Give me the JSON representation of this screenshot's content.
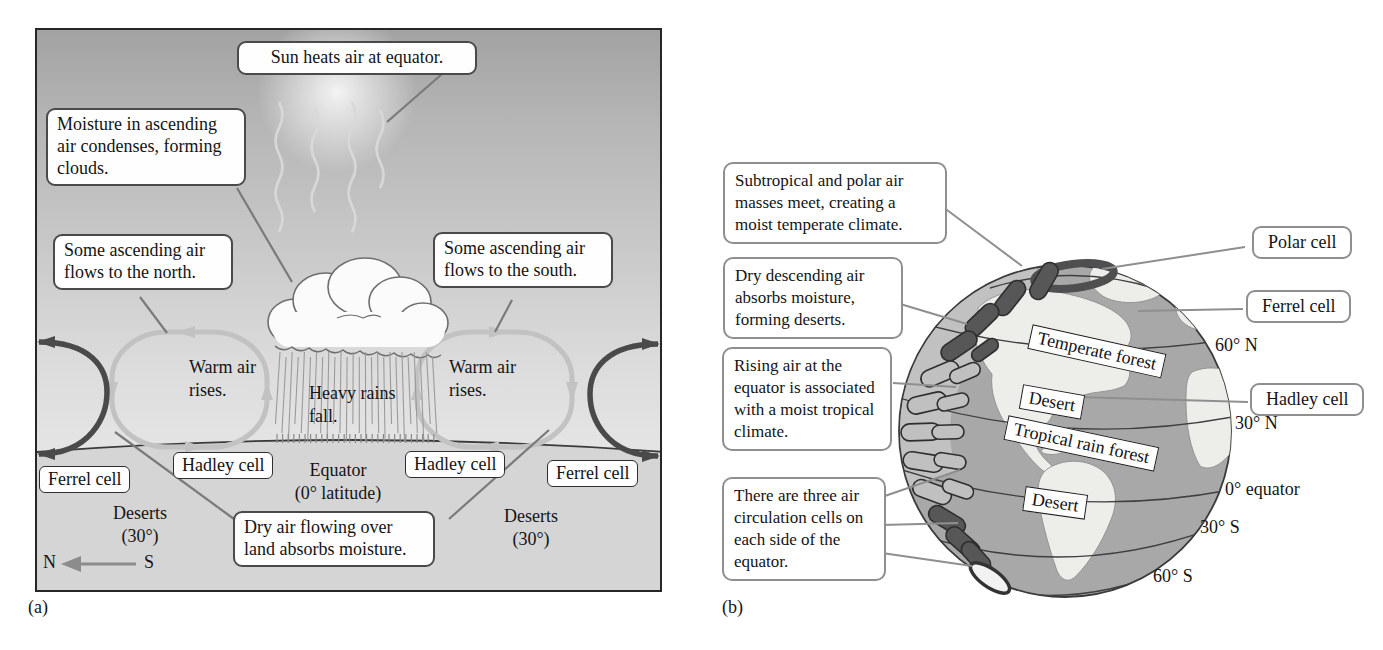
{
  "colors": {
    "cell_dark": "#4f4f4f",
    "cell_light": "#c2c2c2",
    "ocean": "#a8a8a8",
    "land": "#ededea",
    "panel_sky_top": "#a2a2a2",
    "ground": "#d5d5d5",
    "callout_border_a": "#4a4a4a",
    "callout_border_b": "#8f8f8f"
  },
  "panel_a": {
    "label": "(a)",
    "callout_sun": "Sun heats air at equator.",
    "callout_moisture": "Moisture in ascending air condenses, forming clouds.",
    "callout_north": "Some ascending air flows to the north.",
    "callout_south": "Some ascending air flows to the south.",
    "callout_dry": "Dry air flowing over land absorbs moisture.",
    "warm_air": "Warm air rises.",
    "heavy_rains": "Heavy rains fall.",
    "cell_boxes": [
      "Ferrel cell",
      "Hadley cell",
      "Hadley cell",
      "Ferrel cell"
    ],
    "equator_line1": "Equator",
    "equator_line2": "(0° latitude)",
    "deserts_line1": "Deserts",
    "deserts_line2": "(30°)",
    "compass_n": "N",
    "compass_s": "S"
  },
  "panel_b": {
    "label": "(b)",
    "callouts": [
      "Subtropical and polar air masses meet, creating a moist temperate climate.",
      "Dry descending air absorbs moisture, forming deserts.",
      "Rising air at the equator is associated with a moist tropical climate.",
      "There are three air circulation cells on each side of the equator."
    ],
    "cell_labels": [
      "Polar cell",
      "Ferrel cell",
      "Hadley cell"
    ],
    "biomes": [
      "Temperate forest",
      "Desert",
      "Tropical rain forest",
      "Desert"
    ],
    "latitudes": [
      "60° N",
      "30° N",
      "0° equator",
      "30° S",
      "60° S"
    ]
  }
}
